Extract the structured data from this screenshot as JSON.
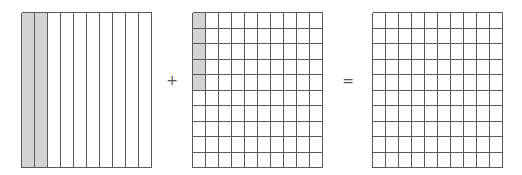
{
  "figure": {
    "operator_plus": "+",
    "operator_equals": "=",
    "colors": {
      "shade": "#d3d3d3",
      "line": "#5a5a5a",
      "background": "#ffffff"
    },
    "grids": [
      {
        "name": "tenths-grid",
        "layout": "columns",
        "columns": 10,
        "rows": 1,
        "shaded_columns": 2,
        "shaded_cells": 0,
        "represents": "0.2"
      },
      {
        "name": "hundredths-grid",
        "layout": "cells",
        "columns": 10,
        "rows": 10,
        "shaded_columns": 0,
        "shaded_cells": 5,
        "shaded_cells_direction": "first column, top to bottom",
        "represents": "0.05"
      },
      {
        "name": "result-grid",
        "layout": "cells",
        "columns": 10,
        "rows": 10,
        "shaded_columns": 0,
        "shaded_cells": 0,
        "represents": "blank (answer to fill)"
      }
    ]
  }
}
